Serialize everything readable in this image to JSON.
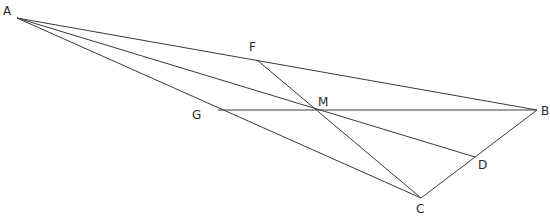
{
  "diagram": {
    "type": "triangle-with-cevians",
    "points": {
      "A": {
        "label": "A",
        "x": 17,
        "y": 18,
        "lx": 3,
        "ly": 5
      },
      "B": {
        "label": "B",
        "x": 537,
        "y": 110,
        "lx": 541,
        "ly": 105
      },
      "C": {
        "label": "C",
        "x": 421,
        "y": 198,
        "lx": 416,
        "ly": 203
      },
      "D": {
        "label": "D",
        "x": 475,
        "y": 157,
        "lx": 478,
        "ly": 159
      },
      "F": {
        "label": "F",
        "x": 257,
        "y": 60,
        "lx": 249,
        "ly": 41
      },
      "G": {
        "label": "G",
        "x": 218,
        "y": 110,
        "lx": 192,
        "ly": 109
      },
      "M": {
        "label": "M",
        "x": 316,
        "y": 110,
        "lx": 318,
        "ly": 96
      }
    },
    "segments": [
      {
        "name": "segment-AB",
        "from": "A",
        "to": "B"
      },
      {
        "name": "segment-AC",
        "from": "A",
        "to": "C"
      },
      {
        "name": "segment-BC",
        "from": "B",
        "to": "C"
      },
      {
        "name": "segment-AD",
        "from": "A",
        "to": "D"
      },
      {
        "name": "segment-GB",
        "from": "G",
        "to": "B"
      },
      {
        "name": "segment-FC",
        "from": "F",
        "to": "C"
      }
    ],
    "line_color": "#3a3a3a",
    "label_color": "#2a2a2a"
  }
}
